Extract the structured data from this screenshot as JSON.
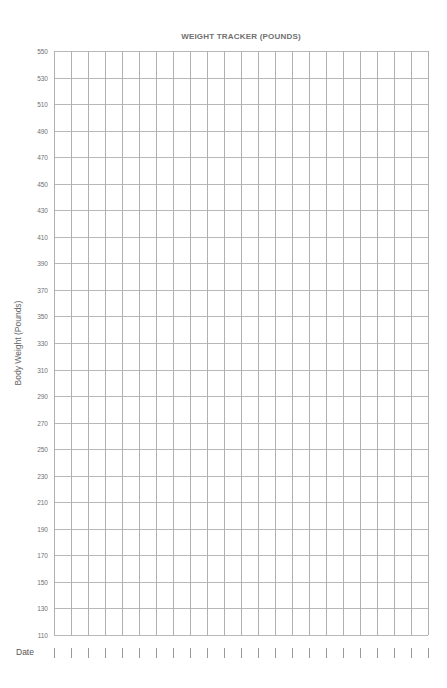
{
  "chart_data": {
    "type": "line",
    "title": "WEIGHT TRACKER (POUNDS)",
    "xlabel": "Date",
    "ylabel": "Body Weight (Pounds)",
    "ylim": [
      110,
      550
    ],
    "yticks": [
      550,
      530,
      510,
      490,
      470,
      450,
      430,
      410,
      390,
      370,
      350,
      330,
      310,
      290,
      270,
      250,
      230,
      210,
      190,
      170,
      150,
      130,
      110
    ],
    "x_columns": 22,
    "series": [],
    "grid": true,
    "legend": "none"
  }
}
